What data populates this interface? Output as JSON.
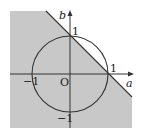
{
  "diagram": {
    "axis_labels": {
      "x": "a",
      "y": "b"
    },
    "ticks": {
      "x_pos": "1",
      "x_neg": "−1",
      "y_pos": "1",
      "y_neg": "−1",
      "origin": "O"
    },
    "shapes": [
      "unit circle a²+b²=1",
      "line a+b=1",
      "shaded region a+b≤1"
    ],
    "colors": {
      "shade": "#c8c8c8",
      "line": "#333333"
    }
  }
}
